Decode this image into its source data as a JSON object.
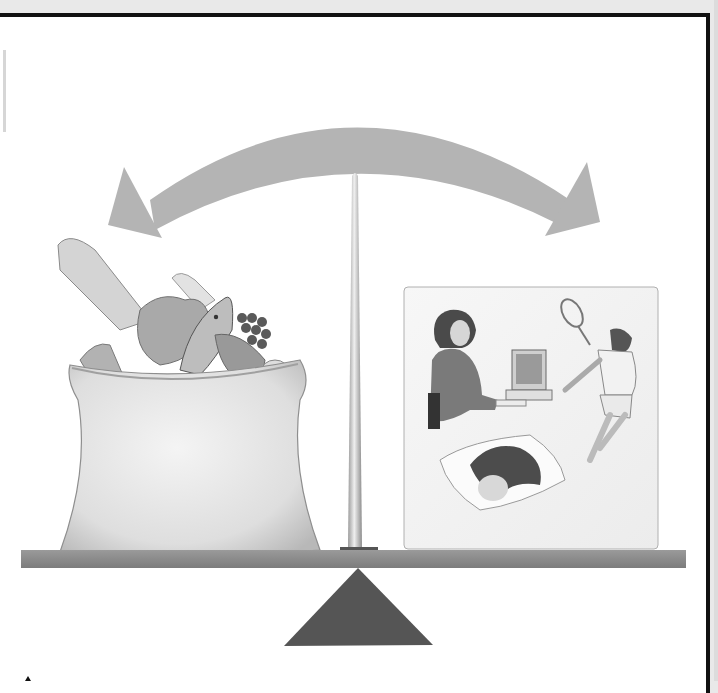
{
  "figure": {
    "title": "Energy balance",
    "left_side": {
      "label": "Energy intake (food)",
      "items": [
        "bread",
        "carrots",
        "lettuce",
        "fish",
        "grapes",
        "meat",
        "corn",
        "onion",
        "chicken leg"
      ]
    },
    "right_side": {
      "label": "Energy expenditure (activity)",
      "items": [
        "working at computer",
        "playing tennis",
        "sleeping"
      ]
    },
    "arrow": {
      "label": "bidirectional balance arrow"
    },
    "fulcrum": {
      "label": "fulcrum"
    }
  },
  "colors": {
    "paper": "#ffffff",
    "arrow": "#b4b4b4",
    "beam": "#8a8a8a",
    "fulcrum": "#555555",
    "post": "#c8c8c8",
    "sack": "#e6e6e6",
    "panel": "#f4f4f4",
    "frame": "#111111"
  }
}
